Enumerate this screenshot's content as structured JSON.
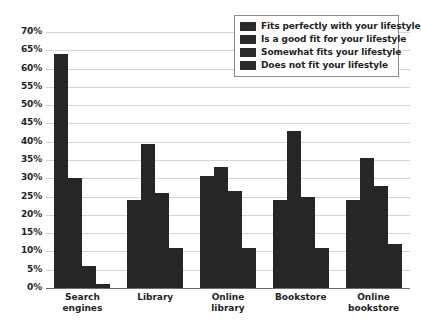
{
  "chart_data": {
    "type": "bar",
    "title": "",
    "subtitle": "",
    "xlabel": "",
    "ylabel": "",
    "ylim": [
      0,
      70
    ],
    "ytick_step": 5,
    "ytick_labels": [
      "70%",
      "65%",
      "60%",
      "55%",
      "50%",
      "45%",
      "40%",
      "35%",
      "30%",
      "25%",
      "20%",
      "15%",
      "10%",
      "5%",
      "0%"
    ],
    "grid": true,
    "legend_position": "top-right",
    "categories": [
      "Search engines",
      "Library",
      "Online library",
      "Bookstore",
      "Online bookstore"
    ],
    "category_lines": [
      [
        "Search",
        "engines"
      ],
      [
        "Library",
        ""
      ],
      [
        "Online",
        "library"
      ],
      [
        "Bookstore",
        ""
      ],
      [
        "Online",
        "bookstore"
      ]
    ],
    "series": [
      {
        "name": "Fits perfectly with your lifestyle",
        "color": "#262626",
        "values": [
          64,
          24,
          30.5,
          24,
          24
        ]
      },
      {
        "name": "Is a good fit for your lifestyle",
        "color": "#262626",
        "values": [
          30,
          39.5,
          33,
          43,
          35.5
        ]
      },
      {
        "name": "Somewhat fits your lifestyle",
        "color": "#262626",
        "values": [
          6,
          26,
          26.5,
          25,
          28
        ]
      },
      {
        "name": "Does not fit your lifestyle",
        "color": "#262626",
        "values": [
          1,
          11,
          11,
          11,
          12
        ]
      }
    ]
  },
  "legend": {
    "items": [
      {
        "label": "Fits perfectly with your lifestyle",
        "swatch": "#2b2b2b"
      },
      {
        "label": "Is a good fit for your lifestyle",
        "swatch": "#2b2b2b"
      },
      {
        "label": "Somewhat fits your lifestyle",
        "swatch": "#2b2b2b"
      },
      {
        "label": "Does not fit your lifestyle",
        "swatch": "#2b2b2b"
      }
    ]
  },
  "colors": {
    "bar": "#262626",
    "grid": "#d4d4d4",
    "axis": "#6e6e6e",
    "text": "#1f1f1f",
    "background": "#ffffff"
  }
}
